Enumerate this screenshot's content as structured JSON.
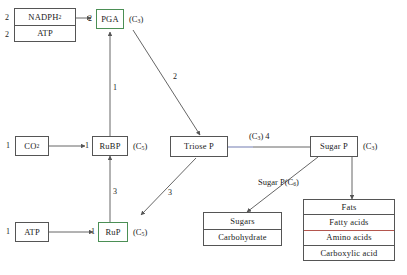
{
  "diagram": {
    "colors": {
      "stroke": "#555555",
      "green_box": "#4b8f55",
      "red_divider": "#b4564e",
      "link_tint": "#7f88b8",
      "text": "#1b1b1b"
    },
    "nodes": {
      "cofactors": {
        "rows": [
          {
            "label": "NADPH",
            "sub": "2",
            "count": "2"
          },
          {
            "label": "ATP",
            "sub": "",
            "count": "2"
          }
        ]
      },
      "pga": {
        "label": "PGA",
        "count": "2",
        "carbon": "(C",
        "carbon_sub": "3",
        "carbon_end": ")"
      },
      "co2": {
        "label": "CO",
        "sub": "2",
        "count": "1"
      },
      "rubp": {
        "label": "RuBP",
        "count": "1",
        "carbon": "(C",
        "carbon_sub": "5",
        "carbon_end": ")"
      },
      "triose_p": {
        "label": "Triose P"
      },
      "sugar_p": {
        "label": "Sugar P",
        "carbon": "(C",
        "carbon_sub": "3",
        "carbon_end": ")"
      },
      "atp": {
        "label": "ATP",
        "count": "1"
      },
      "rup": {
        "label": "RuP",
        "count": "1",
        "carbon": "(C",
        "carbon_sub": "5",
        "carbon_end": ")"
      },
      "sugars_box": {
        "rows": [
          {
            "label": "Sugars"
          },
          {
            "label": "Carbohydrate"
          }
        ]
      },
      "products_box": {
        "rows": [
          {
            "label": "Fats"
          },
          {
            "label": "Fatty acids"
          },
          {
            "label": "Amino acids"
          },
          {
            "label": "Carboxylic acid"
          }
        ]
      }
    },
    "edge_labels": {
      "rubp_to_pga": "1",
      "pga_to_triose": "2",
      "triose_to_rup": "3",
      "rup_to_rubp": "3",
      "triose_to_sugarp_carbon": "(C",
      "triose_to_sugarp_carbon_sub": "3",
      "triose_to_sugarp_carbon_end": ") 4",
      "sugarp_to_sugars": "Sugar P(C",
      "sugarp_to_sugars_sub": "6",
      "sugarp_to_sugars_end": ")"
    }
  }
}
